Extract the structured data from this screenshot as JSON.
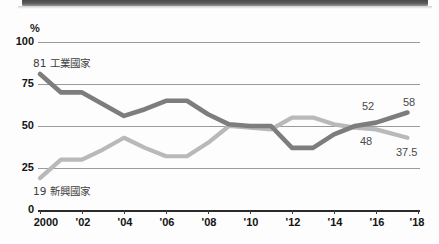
{
  "header": {
    "band": "cropped-dark-header-band"
  },
  "chart_data": {
    "type": "line",
    "title": "",
    "subtitle": "",
    "xlabel": "",
    "ylabel": "%",
    "unit": "%",
    "grid": true,
    "legend_position": "inline-annotations",
    "xlim": [
      2000,
      2018
    ],
    "ylim": [
      0,
      100
    ],
    "yticks": [
      0,
      25,
      50,
      75,
      100
    ],
    "ytick_labels": [
      "0",
      "25",
      "50",
      "75",
      "100"
    ],
    "xticks": [
      2000,
      2002,
      2004,
      2006,
      2008,
      2010,
      2012,
      2014,
      2016,
      2018
    ],
    "xtick_labels": [
      "2000",
      "'02",
      "'04",
      "'06",
      "'08",
      "'10",
      "'12",
      "'14",
      "'16",
      "'18"
    ],
    "x": [
      2000,
      2001,
      2002,
      2003,
      2004,
      2005,
      2006,
      2007,
      2008,
      2009,
      2010,
      2011,
      2012,
      2013,
      2014,
      2015,
      2016,
      2017.5
    ],
    "series": [
      {
        "name": "工業國家",
        "name_romanized": "Industrial countries",
        "color": "#7d7d7d",
        "start_label": "81",
        "end_label": "58",
        "mid_label": "52",
        "values": [
          81,
          70,
          70,
          63,
          56,
          60,
          65,
          65,
          57,
          51,
          50,
          50,
          37,
          37,
          45,
          50,
          52,
          58
        ]
      },
      {
        "name": "新興國家",
        "name_romanized": "Emerging countries",
        "color": "#b9b9b9",
        "start_label": "19",
        "end_label": "37.5",
        "mid_label": "48",
        "values": [
          19,
          30,
          30,
          36,
          43,
          37,
          32,
          32,
          40,
          50,
          49,
          48,
          55,
          55,
          51,
          49,
          48,
          43
        ]
      }
    ],
    "annotations": [
      {
        "id": "industrial-start",
        "text": "81 工業國家",
        "value": 81
      },
      {
        "id": "emerging-start",
        "text": "19 新興國家",
        "value": 19
      },
      {
        "id": "industrial-mid",
        "text": "52",
        "value": 52
      },
      {
        "id": "industrial-end",
        "text": "58",
        "value": 58
      },
      {
        "id": "emerging-mid",
        "text": "48",
        "value": 48
      },
      {
        "id": "emerging-end",
        "text": "37.5",
        "value": 37.5
      }
    ]
  },
  "colors": {
    "industrial_line": "#7d7d7d",
    "emerging_line": "#b9b9b9",
    "gridline": "#9a9a9a",
    "axis": "#2b2b2b",
    "text": "#141414",
    "band": "#4a4a4a"
  }
}
